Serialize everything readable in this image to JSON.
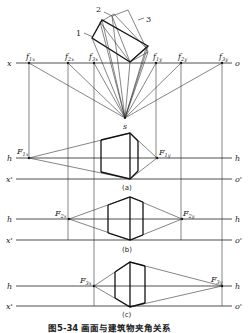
{
  "figure": {
    "caption": "图5-34  画面与建筑物夹角关系",
    "plan_labels": [
      "1",
      "2",
      "3"
    ],
    "axis_labels": {
      "x": "x",
      "o": "o",
      "x_prime": "x'",
      "o_prime": "o'",
      "h": "h",
      "s": "s"
    },
    "vanishing_traces": [
      {
        "label": "f",
        "sub": "1x"
      },
      {
        "label": "f",
        "sub": "2x"
      },
      {
        "label": "f",
        "sub": "3x"
      },
      {
        "label": "f",
        "sub": "1y"
      },
      {
        "label": "f",
        "sub": "2y"
      },
      {
        "label": "f",
        "sub": "3y"
      }
    ],
    "panels": [
      {
        "id": "a",
        "label": "(a)",
        "left_vp": {
          "label": "F",
          "sub": "1x"
        },
        "right_vp": {
          "label": "F",
          "sub": "1y"
        }
      },
      {
        "id": "b",
        "label": "(b)",
        "left_vp": {
          "label": "F",
          "sub": "2x"
        },
        "right_vp": {
          "label": "F",
          "sub": "2y"
        }
      },
      {
        "id": "c",
        "label": "(c)",
        "left_vp": {
          "label": "F",
          "sub": "3x"
        },
        "right_vp": {
          "label": "F",
          "sub": "3y"
        }
      }
    ]
  }
}
